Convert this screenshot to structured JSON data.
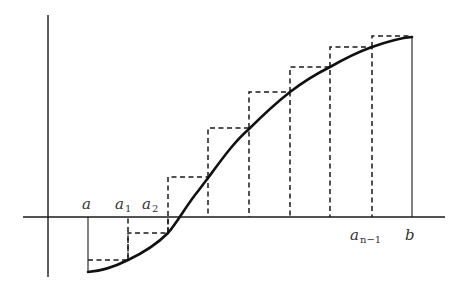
{
  "diagram": {
    "labels": {
      "a": "a",
      "a1": "a",
      "a1_sub": "1",
      "a2": "a",
      "a2_sub": "2",
      "an1": "a",
      "an1_sub": "n−1",
      "b": "b"
    },
    "partition_x_px": [
      88,
      128,
      168,
      208,
      249,
      290,
      330,
      372,
      412
    ],
    "curve_y_px_at_partition": [
      272,
      260,
      233,
      178,
      129,
      92,
      67,
      47,
      37
    ],
    "step_top_y_px": [
      260,
      233,
      177,
      128,
      92,
      67,
      47,
      36
    ],
    "axis": {
      "x_axis_y": 217,
      "y_axis_x": 48
    },
    "colors": {
      "ink": "#1a1a1a",
      "background": "#ffffff"
    }
  }
}
